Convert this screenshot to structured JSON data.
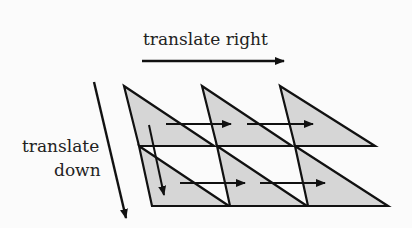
{
  "labels": {
    "right": "translate right",
    "down_line1": "translate",
    "down_line2": "down"
  },
  "colors": {
    "fill": "#d6d6d6",
    "stroke": "#111111",
    "background": "#fbfbfb"
  },
  "tiling": {
    "rows": 2,
    "cols": 3,
    "base_triangle": [
      [
        124,
        86
      ],
      [
        214,
        146
      ],
      [
        139,
        146
      ]
    ],
    "col_offset": [
      78,
      0
    ],
    "row_offset": [
      15,
      60
    ]
  }
}
